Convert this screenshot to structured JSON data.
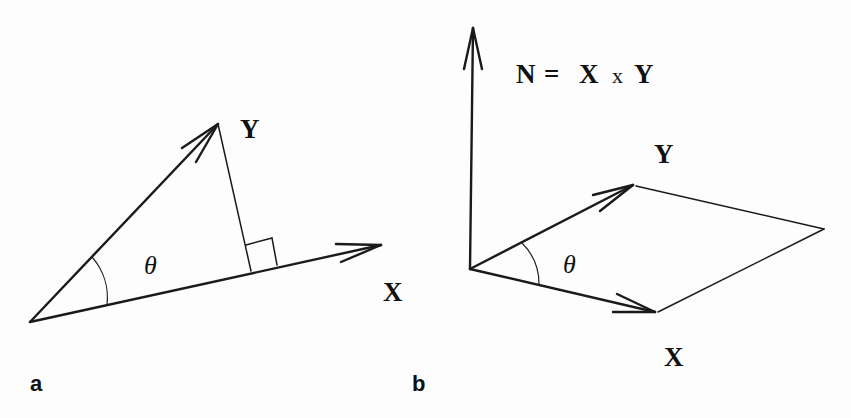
{
  "figure": {
    "panels": [
      {
        "id": "a",
        "letter": "a",
        "description": "Projection of vector Y onto vector X with angle theta and right-angle marker",
        "labels": {
          "y_vector": "Y",
          "angle": "θ"
        }
      },
      {
        "id": "b",
        "letter": "b",
        "description": "Cross product N = X x Y normal to parallelogram spanned by X and Y",
        "labels": {
          "equation_n": "N",
          "equation_eq": "=",
          "equation_x": "X",
          "equation_times": "x",
          "equation_y": "Y",
          "y_vector": "Y",
          "x_vector_left": "X",
          "x_vector_bottom": "X",
          "angle": "θ"
        }
      }
    ],
    "colors": {
      "background": "#fdfdfd",
      "ink": "#1a1a1a"
    }
  }
}
